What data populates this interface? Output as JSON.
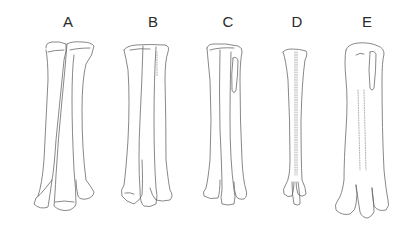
{
  "figure": {
    "panels": [
      {
        "label": "A",
        "x": 68
      },
      {
        "label": "B",
        "x": 153
      },
      {
        "label": "C",
        "x": 228
      },
      {
        "label": "D",
        "x": 297
      },
      {
        "label": "E",
        "x": 367
      }
    ],
    "line_color": "#6a6a6a",
    "background": "#ffffff"
  }
}
